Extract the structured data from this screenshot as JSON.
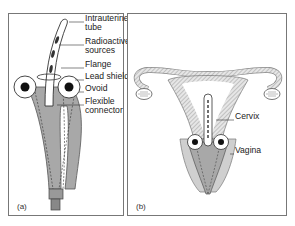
{
  "figure": {
    "panels": [
      {
        "id": "a",
        "letter": "(a)",
        "labels": [
          {
            "text": "Intrauterine",
            "x": 77,
            "y": 4
          },
          {
            "text": "tube",
            "x": 77,
            "y": 13
          },
          {
            "text": "Radioactive",
            "x": 77,
            "y": 27
          },
          {
            "text": "sources",
            "x": 77,
            "y": 36
          },
          {
            "text": "Flange",
            "x": 77,
            "y": 50
          },
          {
            "text": "Lead shield",
            "x": 77,
            "y": 62
          },
          {
            "text": "Ovoid",
            "x": 77,
            "y": 74
          },
          {
            "text": "Flexible",
            "x": 77,
            "y": 87
          },
          {
            "text": "connector",
            "x": 77,
            "y": 96
          }
        ]
      },
      {
        "id": "b",
        "letter": "(b)",
        "labels": [
          {
            "text": "Cervix",
            "x": 108,
            "y": 102
          },
          {
            "text": "Vagina",
            "x": 108,
            "y": 136
          }
        ]
      }
    ]
  },
  "colors": {
    "border": "#777777",
    "device_fill": "#a8a8a8",
    "tissue_fill": "#cfcfcf",
    "ink": "#222222"
  }
}
